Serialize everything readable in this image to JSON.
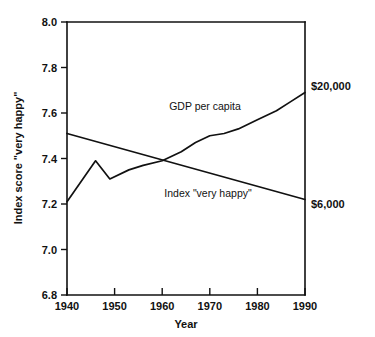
{
  "chart_data": {
    "type": "line",
    "title": "",
    "xlabel": "Year",
    "ylabel": "Index score \"very happy\"",
    "xlim": [
      1940,
      1990
    ],
    "ylim": [
      6.8,
      8.0
    ],
    "grid": false,
    "legend_position": "inline-annotations",
    "xticks": [
      "1940",
      "1950",
      "1960",
      "1970",
      "1980",
      "1990"
    ],
    "xtick_values": [
      1940,
      1950,
      1960,
      1970,
      1980,
      1990
    ],
    "yticks": [
      "6.8",
      "7.0",
      "7.2",
      "7.4",
      "7.6",
      "7.8",
      "8.0"
    ],
    "ytick_values": [
      6.8,
      7.0,
      7.2,
      7.4,
      7.6,
      7.8,
      8.0
    ],
    "series": [
      {
        "name": "Index \"very happy\"",
        "label": "Index \"very happy\"",
        "end_label": "$6,000",
        "x": [
          1940,
          1990
        ],
        "values": [
          7.51,
          7.22
        ]
      },
      {
        "name": "GDP per capita",
        "label": "GDP per capita",
        "end_label": "$20,000",
        "x": [
          1940,
          1946,
          1949,
          1953,
          1956,
          1960,
          1964,
          1967,
          1970,
          1973,
          1976,
          1980,
          1984,
          1987,
          1990
        ],
        "values": [
          7.21,
          7.39,
          7.31,
          7.35,
          7.37,
          7.39,
          7.43,
          7.47,
          7.5,
          7.51,
          7.53,
          7.57,
          7.61,
          7.65,
          7.69
        ]
      }
    ],
    "annotations": [
      {
        "text": "GDP per capita",
        "x": 1958,
        "y": 7.62
      },
      {
        "text": "Index \"very happy\"",
        "x": 1959,
        "y": 7.24
      },
      {
        "text": "$20,000",
        "x": 1991,
        "y": 7.69
      },
      {
        "text": "$6,000",
        "x": 1991,
        "y": 7.22
      }
    ]
  },
  "colors": {
    "line": "#111111",
    "axis": "#111111",
    "background": "#ffffff"
  }
}
